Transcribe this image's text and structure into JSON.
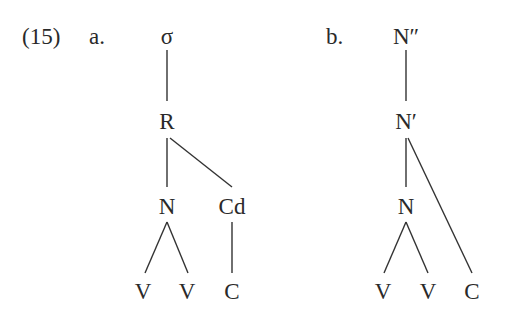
{
  "example": {
    "number": "(15)",
    "tree_a": {
      "label": "a.",
      "nodes": {
        "root": "σ",
        "rhyme": "R",
        "nucleus": "N",
        "coda": "Cd",
        "v1": "V",
        "v2": "V",
        "c": "C"
      }
    },
    "tree_b": {
      "label": "b.",
      "nodes": {
        "root": "N″",
        "bar": "N′",
        "head": "N",
        "v1": "V",
        "v2": "V",
        "c": "C"
      }
    }
  }
}
